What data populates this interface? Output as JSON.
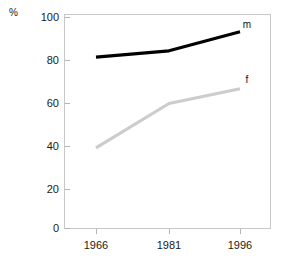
{
  "chart_data": {
    "type": "line",
    "title": "",
    "xlabel": "",
    "ylabel": "%",
    "unit_label": "%",
    "categories": [
      "1966",
      "1981",
      "1996"
    ],
    "x": [
      1966,
      1981,
      1996
    ],
    "xlim": [
      1961,
      2001
    ],
    "ylim": [
      0,
      100
    ],
    "yticks": [
      "0",
      "20",
      "40",
      "60",
      "80",
      "100"
    ],
    "ytick_values": [
      0,
      20,
      40,
      60,
      80,
      100
    ],
    "grid": false,
    "legend_position": "inline-right-of-line-ends",
    "series": [
      {
        "name": "m",
        "label": "m",
        "color": "#000000",
        "values": [
          81,
          84,
          93
        ]
      },
      {
        "name": "f",
        "label": "f",
        "color": "#cccccc",
        "values": [
          38,
          59,
          66
        ]
      }
    ]
  },
  "axes": {
    "y_unit": "%",
    "y_tick_labels": [
      "100",
      "80",
      "60",
      "40",
      "20",
      "0"
    ],
    "x_tick_labels": [
      "1966",
      "1981",
      "1996"
    ]
  },
  "series_labels": {
    "male": "m",
    "female": "f"
  },
  "colors": {
    "male_line": "#000000",
    "female_line": "#cccccc",
    "frame": "#c8c8c8",
    "text": "#1a1a1a",
    "background": "#ffffff"
  }
}
